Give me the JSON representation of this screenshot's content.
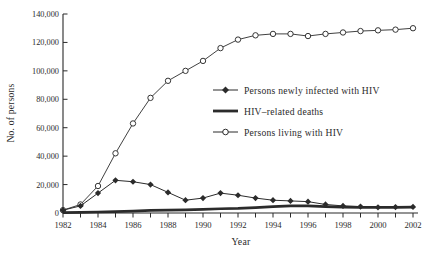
{
  "figure": {
    "background": "#ffffff",
    "ink_color": "#2b2b2b"
  },
  "chart_data": {
    "type": "line",
    "title": "",
    "xlabel": "Year",
    "ylabel": "No. of persons",
    "grid": false,
    "legend_position": "inside-center-right",
    "ylim": [
      0,
      140000
    ],
    "y_ticks": [
      0,
      20000,
      40000,
      60000,
      80000,
      100000,
      120000,
      140000
    ],
    "y_tick_labels": [
      "0",
      "20,000",
      "40,000",
      "60,000",
      "80,000",
      "100,000",
      "120,000",
      "140,000"
    ],
    "x_tick_labels": [
      "1982",
      "1984",
      "1986",
      "1988",
      "1990",
      "1992",
      "1994",
      "1996",
      "1998",
      "2000",
      "2002"
    ],
    "x": [
      1982,
      1983,
      1984,
      1985,
      1986,
      1987,
      1988,
      1989,
      1990,
      1991,
      1992,
      1993,
      1994,
      1995,
      1996,
      1997,
      1998,
      1999,
      2000,
      2001,
      2002
    ],
    "series": [
      {
        "name": "Persons newly infected with HIV",
        "marker": "diamond",
        "line_width": 1,
        "values": [
          2000,
          5000,
          14000,
          23000,
          22000,
          20000,
          14500,
          9000,
          10500,
          14000,
          12500,
          10500,
          9000,
          8500,
          8000,
          6000,
          5000,
          4500,
          4000,
          4200,
          4300
        ]
      },
      {
        "name": "HIV–related deaths",
        "marker": "none",
        "line_width": 2.7,
        "values": [
          200,
          400,
          700,
          1000,
          1300,
          1800,
          2000,
          2200,
          2500,
          3000,
          3200,
          3800,
          4500,
          5000,
          5000,
          4500,
          4200,
          4000,
          4000,
          4000,
          4200
        ]
      },
      {
        "name": "Persons living with HIV",
        "marker": "circle",
        "line_width": 0.9,
        "values": [
          2000,
          6000,
          19000,
          42000,
          63000,
          81000,
          93000,
          100000,
          107000,
          116000,
          122000,
          125000,
          126000,
          126000,
          124500,
          126000,
          127000,
          128000,
          128500,
          129000,
          130000
        ]
      }
    ]
  }
}
